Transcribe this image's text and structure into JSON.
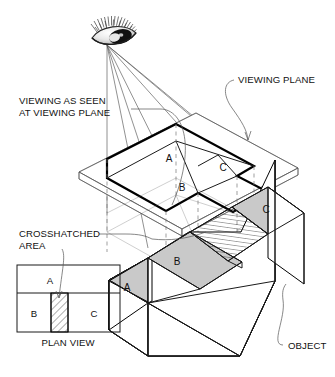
{
  "diagram": {
    "type": "technical-illustration"
  },
  "annotations": {
    "viewing_as_seen_line1": "VIEWING AS SEEN",
    "viewing_as_seen_line2": "AT VIEWING PLANE",
    "viewing_plane": "VIEWING PLANE",
    "crosshatched_line1": "CROSSHATCHED",
    "crosshatched_line2": "AREA",
    "object": "OBJECT",
    "plan_view": "PLAN VIEW"
  },
  "projected_view": {
    "faces": [
      {
        "id": "A",
        "label": "A"
      },
      {
        "id": "B",
        "label": "B"
      },
      {
        "id": "C",
        "label": "C"
      }
    ]
  },
  "object_faces": [
    {
      "id": "A",
      "label": "A",
      "fill": "#c9c9c9"
    },
    {
      "id": "B",
      "label": "B",
      "fill": "#c9c9c9"
    },
    {
      "id": "C",
      "label": "C",
      "fill": "#c9c9c9"
    }
  ],
  "plan_view": {
    "caption": "PLAN VIEW",
    "cells": [
      {
        "id": "A",
        "label": "A",
        "hatched": false
      },
      {
        "id": "B",
        "label": "B",
        "hatched": false
      },
      {
        "id": "H",
        "label": "",
        "hatched": true
      },
      {
        "id": "C",
        "label": "C",
        "hatched": false
      }
    ]
  },
  "icons": {
    "eye": "eye-icon"
  },
  "colors": {
    "face_gray": "#c9c9c9",
    "outline": "#000000",
    "thin_line": "#6b6b6b",
    "dashed": "#777777",
    "background": "#ffffff"
  }
}
